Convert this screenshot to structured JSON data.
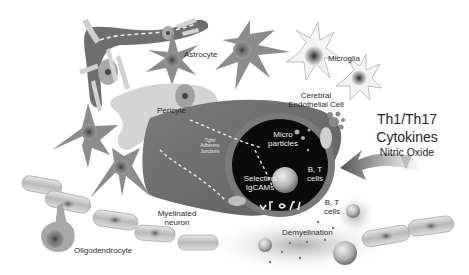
{
  "figure": {
    "type": "biological-schematic",
    "colors": {
      "background": "#ffffff",
      "cell_gray": "#8a8a8a",
      "dark_gray": "#5a5a5a",
      "light_gray": "#d8d8d8",
      "lumen_black": "#0a0a0a",
      "label_text": "#222222",
      "label_text_on_dark": "#eeeeee"
    }
  },
  "labels": {
    "astrocyte": "Astrocyte",
    "microglia": "Microglia",
    "cerebral_endothelial_line1": "Cerebral",
    "cerebral_endothelial_line2": "Endothelial Cell",
    "pericyte": "Pericyte",
    "tight_junctions_line1": "Tight/",
    "tight_junctions_line2": "Adherens",
    "tight_junctions_line3": "Junctions",
    "microparticles_line1": "Micro",
    "microparticles_line2": "particles",
    "bt_cells_lumen_line1": "B, T",
    "bt_cells_lumen_line2": "cells",
    "selectins_line1": "Selectins",
    "selectins_line2": "IgCAMs",
    "bt_cells_outside_line1": "B, T",
    "bt_cells_outside_line2": "cells",
    "myelinated_line1": "Myelinated",
    "myelinated_line2": "neuron",
    "oligodendrocyte": "Oligodendrocyte",
    "demyelination": "Demyelination",
    "cytokines_line1": "Th1/Th17",
    "cytokines_line2": "Cytokines",
    "cytokines_line3": "Nitric Oxide"
  }
}
